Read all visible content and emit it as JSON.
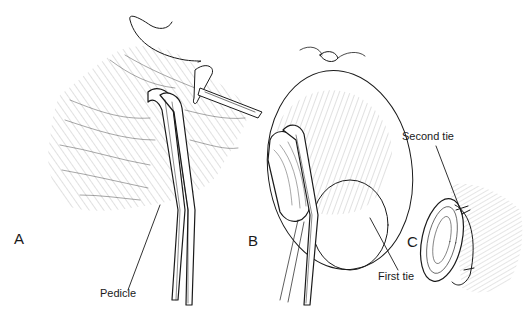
{
  "figure": {
    "panels": [
      {
        "id": "A",
        "label": "A"
      },
      {
        "id": "B",
        "label": "B"
      },
      {
        "id": "C",
        "label": "C"
      }
    ],
    "callouts": {
      "pedicle": "Pedicle",
      "first_tie": "First tie",
      "second_tie": "Second tie"
    },
    "colors": {
      "ink": "#1a1a1a",
      "background": "#ffffff"
    }
  }
}
